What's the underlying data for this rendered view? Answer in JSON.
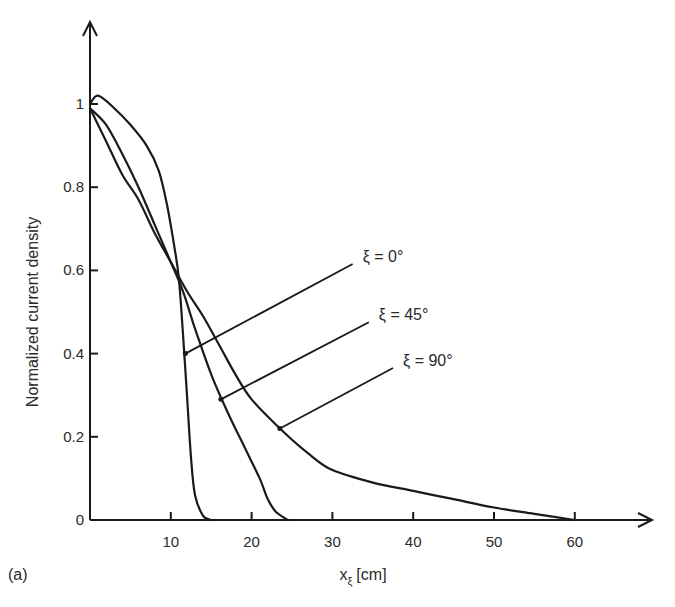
{
  "chart_data": {
    "type": "line",
    "title": "",
    "panel_label": "(a)",
    "xlabel": "x",
    "xlabel_sub": "ξ",
    "xlabel_unit": "[cm]",
    "ylabel": "Normalized current density",
    "xlim": [
      0,
      68
    ],
    "ylim": [
      0,
      1.15
    ],
    "x_ticks": [
      10,
      20,
      30,
      40,
      50,
      60
    ],
    "x_tick_labels": [
      "10",
      "20",
      "30",
      "40",
      "50",
      "60"
    ],
    "y_ticks": [
      0,
      0.2,
      0.4,
      0.6,
      0.8,
      1
    ],
    "y_tick_labels": [
      "0",
      "0.2",
      "0.4",
      "0.6",
      "0.8",
      "1"
    ],
    "grid": false,
    "legend_position": "inline annotations with leader lines",
    "series": [
      {
        "name": "ξ = 0°",
        "x": [
          0,
          1,
          3,
          5,
          7,
          8.5,
          9.5,
          10.5,
          11,
          11.5,
          12,
          12.5,
          13,
          14,
          15
        ],
        "y": [
          1.0,
          1.02,
          0.99,
          0.95,
          0.9,
          0.84,
          0.76,
          0.65,
          0.58,
          0.45,
          0.3,
          0.15,
          0.06,
          0.01,
          0
        ]
      },
      {
        "name": "ξ = 45°",
        "x": [
          0,
          2,
          4,
          6,
          8,
          10,
          11.5,
          13,
          15,
          17,
          19,
          21,
          22,
          23,
          24.5
        ],
        "y": [
          0.99,
          0.95,
          0.88,
          0.8,
          0.71,
          0.62,
          0.55,
          0.46,
          0.35,
          0.26,
          0.18,
          0.1,
          0.05,
          0.02,
          0
        ]
      },
      {
        "name": "ξ = 90°",
        "x": [
          0,
          2,
          4,
          6,
          8,
          10,
          12,
          14,
          16,
          18,
          20,
          23.5,
          27,
          30,
          35,
          40,
          45,
          50,
          55,
          60
        ],
        "y": [
          0.99,
          0.91,
          0.83,
          0.77,
          0.69,
          0.62,
          0.55,
          0.49,
          0.42,
          0.35,
          0.29,
          0.22,
          0.16,
          0.12,
          0.09,
          0.07,
          0.05,
          0.03,
          0.015,
          0
        ]
      }
    ],
    "annotations": [
      {
        "text": "ξ = 0°",
        "point": [
          11.8,
          0.4
        ],
        "label_at": [
          33,
          0.62
        ]
      },
      {
        "text": "ξ = 45°",
        "point": [
          16.2,
          0.29
        ],
        "label_at": [
          35,
          0.48
        ]
      },
      {
        "text": "ξ = 90°",
        "point": [
          23.5,
          0.22
        ],
        "label_at": [
          38,
          0.37
        ]
      }
    ]
  }
}
